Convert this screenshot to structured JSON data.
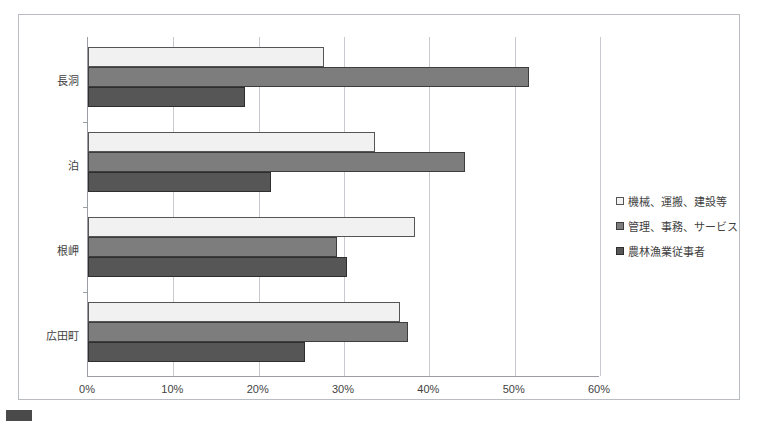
{
  "chart_data": {
    "type": "bar",
    "orientation": "horizontal",
    "title": "",
    "xlabel": "",
    "ylabel": "",
    "xlim": [
      0,
      60
    ],
    "xticks": [
      "0%",
      "10%",
      "20%",
      "30%",
      "40%",
      "50%",
      "60%"
    ],
    "xtick_values": [
      0,
      10,
      20,
      30,
      40,
      50,
      60
    ],
    "grid": true,
    "legend_position": "right",
    "categories": [
      "長洞",
      "泊",
      "根岬",
      "広田町"
    ],
    "series": [
      {
        "name": "機械、運搬、建設等",
        "color": "#f1f1f1",
        "values": [
          27.6,
          33.6,
          38.3,
          36.6
        ]
      },
      {
        "name": "管理、事務、サービス",
        "color": "#7d7d7d",
        "values": [
          51.7,
          44.2,
          29.2,
          37.5
        ]
      },
      {
        "name": "農林漁業従事者",
        "color": "#565656",
        "values": [
          18.4,
          21.5,
          30.3,
          25.4
        ]
      }
    ]
  },
  "legend": {
    "items": [
      {
        "label": "機械、運搬、建設等"
      },
      {
        "label": "管理、事務、サービス"
      },
      {
        "label": "農林漁業従事者"
      }
    ]
  },
  "caption": {
    "text": ""
  }
}
